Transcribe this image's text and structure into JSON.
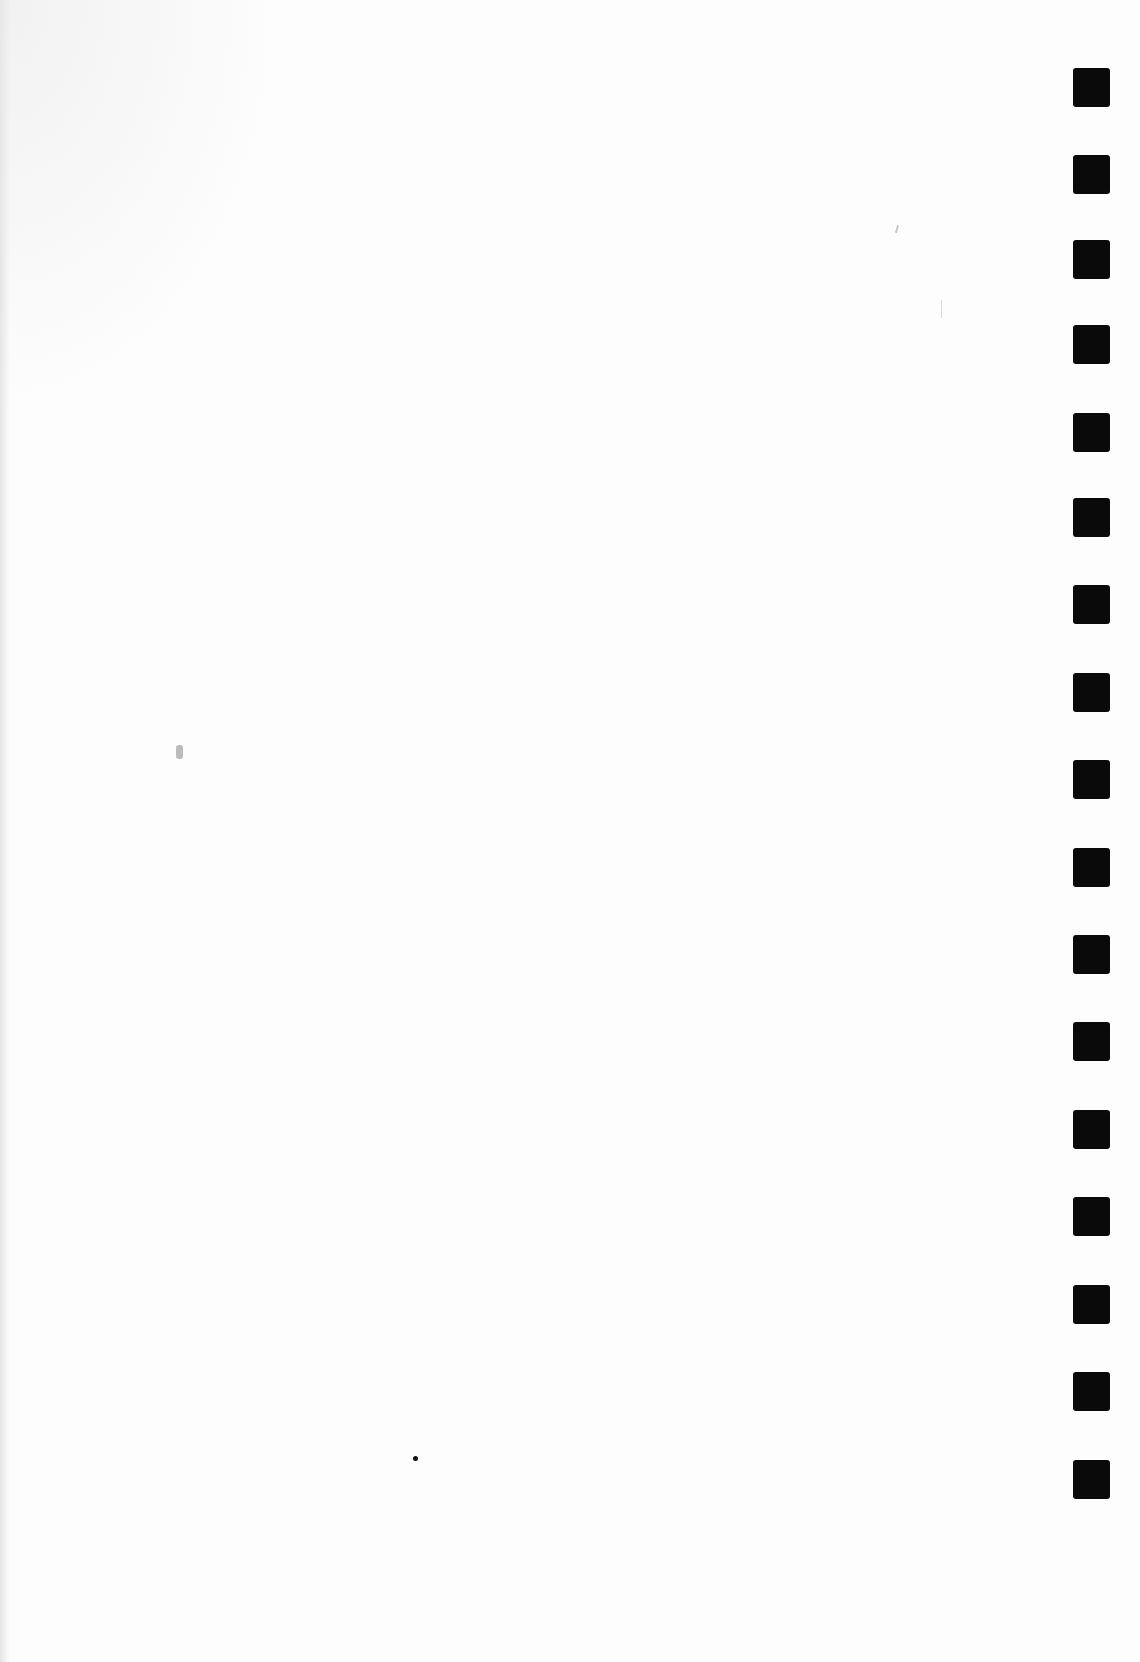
{
  "document": {
    "type": "scanned blank page",
    "text_content": "",
    "background_color": "#fdfdfd",
    "binding_marks": {
      "count": 17,
      "color": "#0a0a0a",
      "x": 1073,
      "width": 37,
      "height": 39,
      "top_positions": [
        68,
        155,
        240,
        325,
        413,
        498,
        585,
        673,
        760,
        848,
        935,
        1022,
        1110,
        1197,
        1285,
        1372,
        1460
      ]
    }
  }
}
